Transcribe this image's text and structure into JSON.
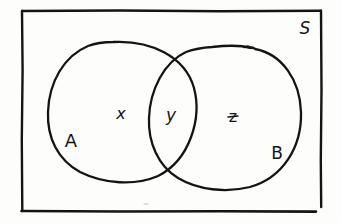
{
  "diagram": {
    "type": "venn",
    "universe": {
      "label": "S"
    },
    "sets": [
      {
        "id": "A",
        "label": "A"
      },
      {
        "id": "B",
        "label": "B"
      }
    ],
    "regions": [
      {
        "id": "only-A",
        "sets": [
          "A"
        ],
        "label": "x"
      },
      {
        "id": "A-and-B",
        "sets": [
          "A",
          "B"
        ],
        "label": "y"
      },
      {
        "id": "only-B",
        "sets": [
          "B"
        ],
        "label": "z"
      }
    ],
    "colors": {
      "ink": "#141414",
      "paper": "#fdfdfb"
    }
  }
}
